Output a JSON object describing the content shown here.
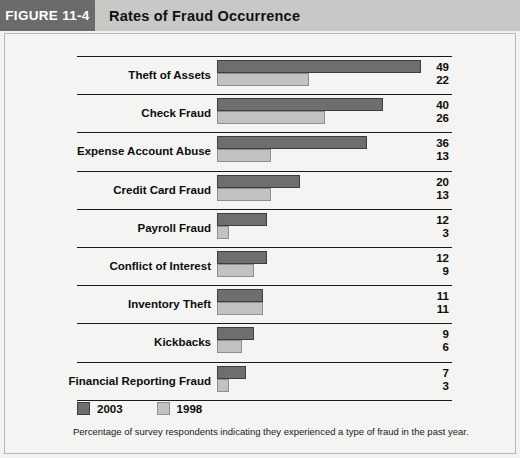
{
  "header": {
    "figure_tag": "FIGURE 11-4",
    "title": "Rates of Fraud Occurrence"
  },
  "legend": {
    "items": [
      {
        "label": "2003",
        "color": "#6e6e6e"
      },
      {
        "label": "1998",
        "color": "#c2c2c2"
      }
    ]
  },
  "caption": "Percentage of survey respondents indicating they experienced a type of fraud in the past year.",
  "chart_data": {
    "type": "bar",
    "orientation": "horizontal",
    "title": "Rates of Fraud Occurrence",
    "xlabel": "",
    "ylabel": "",
    "xlim": [
      0,
      49
    ],
    "grid": false,
    "legend_position": "bottom-left",
    "categories": [
      "Theft of Assets",
      "Check Fraud",
      "Expense Account Abuse",
      "Credit Card Fraud",
      "Payroll Fraud",
      "Conflict of Interest",
      "Inventory Theft",
      "Kickbacks",
      "Financial Reporting Fraud"
    ],
    "series": [
      {
        "name": "2003",
        "color": "#6e6e6e",
        "values": [
          49,
          40,
          36,
          20,
          12,
          12,
          11,
          9,
          7
        ]
      },
      {
        "name": "1998",
        "color": "#c2c2c2",
        "values": [
          22,
          26,
          13,
          13,
          3,
          9,
          11,
          6,
          3
        ]
      }
    ],
    "value_labels": [
      {
        "category": "Theft of Assets",
        "2003": "49",
        "1998": "22"
      },
      {
        "category": "Check Fraud",
        "2003": "40",
        "1998": "26"
      },
      {
        "category": "Expense Account Abuse",
        "2003": "36",
        "1998": "13"
      },
      {
        "category": "Credit Card Fraud",
        "2003": "20",
        "1998": "13"
      },
      {
        "category": "Payroll Fraud",
        "2003": "12",
        "1998": "3"
      },
      {
        "category": "Conflict of Interest",
        "2003": "12",
        "1998": "9"
      },
      {
        "category": "Inventory Theft",
        "2003": "11",
        "1998": "11"
      },
      {
        "category": "Kickbacks",
        "2003": "9",
        "1998": "6"
      },
      {
        "category": "Financial Reporting Fraud",
        "2003": "7",
        "1998": "3"
      }
    ]
  }
}
